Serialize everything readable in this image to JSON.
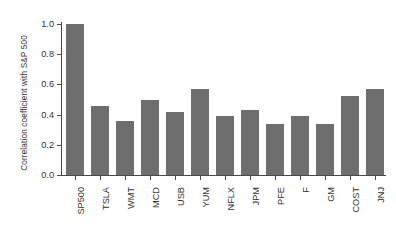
{
  "chart_data": {
    "type": "bar",
    "title": "",
    "xlabel": "",
    "ylabel": "Correlation coefficient with S&P 500",
    "ylim": [
      0.0,
      1.0
    ],
    "ytick_labels": [
      "0.0",
      "0.2",
      "0.4",
      "0.6",
      "0.8",
      "1.0"
    ],
    "ytick_values": [
      0.0,
      0.2,
      0.4,
      0.6,
      0.8,
      1.0
    ],
    "grid": false,
    "legend": null,
    "bar_color": "#6e6e6e",
    "axis_color": "#4a4a4a",
    "text_color": "#333333",
    "background": "#ffffff",
    "categories": [
      "SP500",
      "TSLA",
      "WMT",
      "MCD",
      "USB",
      "YUM",
      "NFLX",
      "JPM",
      "PFE",
      "F",
      "GM",
      "COST",
      "JNJ"
    ],
    "values": [
      1.0,
      0.46,
      0.36,
      0.5,
      0.42,
      0.57,
      0.39,
      0.43,
      0.34,
      0.39,
      0.34,
      0.52,
      0.57
    ],
    "series": [
      {
        "name": "Correlation coefficient with S&P 500",
        "values": [
          1.0,
          0.46,
          0.36,
          0.5,
          0.42,
          0.57,
          0.39,
          0.43,
          0.34,
          0.39,
          0.34,
          0.52,
          0.57
        ]
      }
    ]
  }
}
